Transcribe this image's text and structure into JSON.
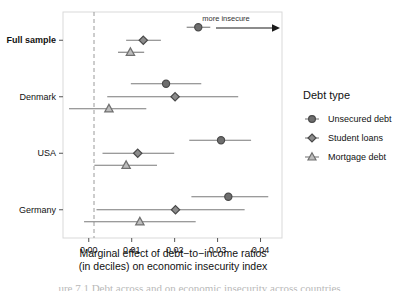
{
  "chart_data": {
    "type": "scatter",
    "title": "",
    "xlabel": "Marginal effect of debt-to-income ratios (in deciles) on economic insecurity index",
    "xlabel_line1": "Marginal effect of debt−to−income ratios",
    "xlabel_line2": "(in deciles) on economic insecurity index",
    "ylabel": "",
    "xlim": [
      -0.006,
      0.045
    ],
    "xticks": [
      0.0,
      0.01,
      0.02,
      0.03,
      0.04
    ],
    "xticklabels": [
      "0.00",
      "0.01",
      "0.02",
      "0.03",
      "0.04"
    ],
    "grid": false,
    "reference_line": 0.0,
    "reference_line_style": "dashed",
    "legend_position": "right",
    "legend_title": "Debt type",
    "categories": [
      "Full sample",
      "Denmark",
      "USA",
      "Germany"
    ],
    "category_styles": [
      "bold",
      "normal",
      "normal",
      "normal"
    ],
    "series": [
      {
        "name": "Unsecured debt",
        "marker": "circle",
        "color": "#4a4a4a",
        "fill": "#6e6e6e",
        "points": [
          {
            "group": "Full sample",
            "estimate": 0.0255,
            "ci_low": 0.0228,
            "ci_high": 0.0283
          },
          {
            "group": "Denmark",
            "estimate": 0.018,
            "ci_low": 0.0098,
            "ci_high": 0.0262
          },
          {
            "group": "USA",
            "estimate": 0.0308,
            "ci_low": 0.0234,
            "ci_high": 0.0378
          },
          {
            "group": "Germany",
            "estimate": 0.0325,
            "ci_low": 0.0239,
            "ci_high": 0.0418
          }
        ]
      },
      {
        "name": "Student loans",
        "marker": "diamond",
        "color": "#4a4a4a",
        "fill": "#8c8c8c",
        "points": [
          {
            "group": "Full sample",
            "estimate": 0.0127,
            "ci_low": 0.0087,
            "ci_high": 0.0168
          },
          {
            "group": "Denmark",
            "estimate": 0.0201,
            "ci_low": 0.0043,
            "ci_high": 0.0348
          },
          {
            "group": "USA",
            "estimate": 0.0114,
            "ci_low": 0.0032,
            "ci_high": 0.0199
          },
          {
            "group": "Germany",
            "estimate": 0.0202,
            "ci_low": 0.0018,
            "ci_high": 0.0363
          }
        ]
      },
      {
        "name": "Mortgage debt",
        "marker": "triangle",
        "color": "#707070",
        "fill": "#bdbdbd",
        "points": [
          {
            "group": "Full sample",
            "estimate": 0.0097,
            "ci_low": 0.0068,
            "ci_high": 0.0129
          },
          {
            "group": "Denmark",
            "estimate": 0.0047,
            "ci_low": -0.0046,
            "ci_high": 0.0134
          },
          {
            "group": "USA",
            "estimate": 0.0087,
            "ci_low": 0.0013,
            "ci_high": 0.0159
          },
          {
            "group": "Germany",
            "estimate": 0.0119,
            "ci_low": -0.0011,
            "ci_high": 0.0249
          }
        ]
      }
    ],
    "annotation": {
      "text": "more insecure",
      "arrow_direction": "right",
      "x_start": 0.0295,
      "x_end": 0.0432
    }
  },
  "legend": {
    "title": "Debt type",
    "items": [
      {
        "label": "Unsecured debt",
        "marker": "circle"
      },
      {
        "label": "Student loans",
        "marker": "diamond"
      },
      {
        "label": "Mortgage debt",
        "marker": "triangle"
      }
    ]
  },
  "colors": {
    "panel_border": "#d9d9d9",
    "reference_line": "#9a9a9a",
    "text": "#111111",
    "whisker": "#7a7a7a"
  },
  "caption": {
    "cut_off_text": "ure 7.1  Debt across and on economic insecurity across countries"
  }
}
